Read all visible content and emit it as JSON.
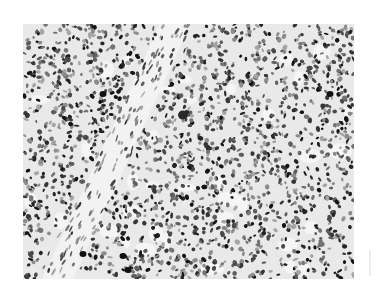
{
  "image": {
    "description": "Grayscale histology micrograph showing densely packed, hyperchromatic round-to-oval nuclei with a lighter diagonal band of spindle-shaped stromal cells",
    "colors": {
      "background": "#ffffff",
      "tissue_base": "#e9e9e9",
      "nucleus_dark": "#1a1a1a",
      "nucleus_mid": "#5a5a5a",
      "nucleus_light": "#9a9a9a",
      "stroma": "#f2f2f2"
    },
    "layout": {
      "x": 23,
      "y": 24,
      "width": 331,
      "height": 255
    },
    "features": {
      "stromal_band": "diagonal from upper-center (~x=180,y=25) toward lower-left (~x=60,y=280)",
      "prominent_nucleus": {
        "x": 183,
        "y": 115
      }
    }
  }
}
